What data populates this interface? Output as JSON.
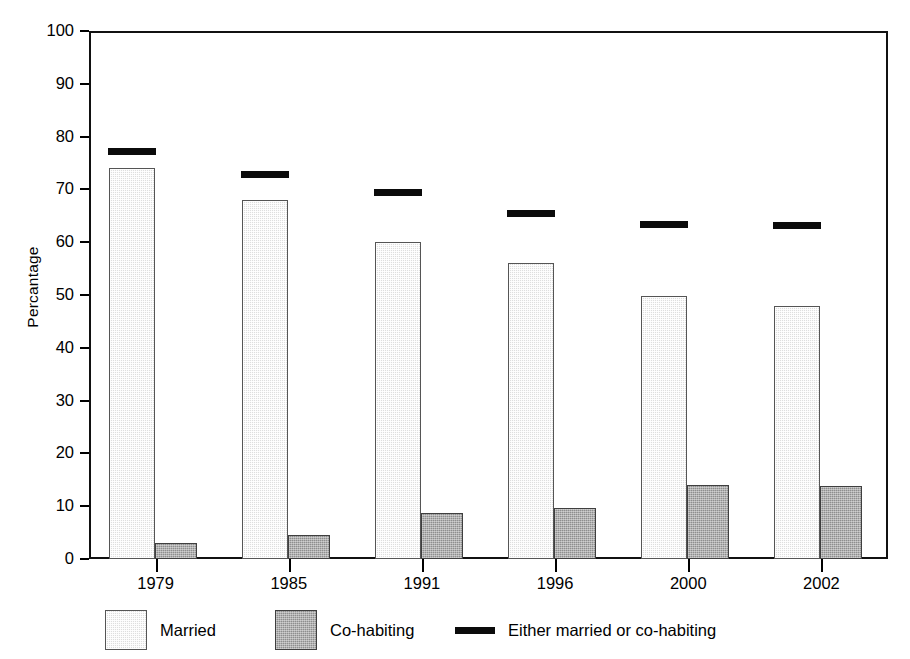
{
  "chart_data": {
    "type": "bar",
    "title": "",
    "subtitle": "",
    "xlabel": "",
    "ylabel": "Percantage",
    "ylim": [
      0,
      100
    ],
    "yticks": [
      0,
      10,
      20,
      30,
      40,
      50,
      60,
      70,
      80,
      90,
      100
    ],
    "ytick_labels": [
      "0",
      "10",
      "20",
      "30",
      "40",
      "50",
      "60",
      "70",
      "80",
      "90",
      "100"
    ],
    "grid": false,
    "legend_position": "bottom",
    "categories": [
      "1979",
      "1985",
      "1991",
      "1996",
      "2000",
      "2002"
    ],
    "series": [
      {
        "name": "Married",
        "kind": "bar",
        "color": "#dedede",
        "values": [
          74.0,
          68.0,
          60.0,
          56.0,
          49.8,
          48.0
        ]
      },
      {
        "name": "Co-habiting",
        "kind": "bar",
        "color": "#8e8e8e",
        "values": [
          3.1,
          4.6,
          8.7,
          9.6,
          14.0,
          13.9
        ]
      },
      {
        "name": "Either married or co-habiting",
        "kind": "marker-line",
        "color": "#0b0b0b",
        "values": [
          77.1,
          72.8,
          69.5,
          65.4,
          63.3,
          63.1
        ]
      }
    ]
  },
  "legend": {
    "items": [
      {
        "label": "Married",
        "marker": "swatch-light-gray"
      },
      {
        "label": "Co-habiting",
        "marker": "swatch-dark-gray"
      },
      {
        "label": "Either married or co-habiting",
        "marker": "black-line"
      }
    ]
  }
}
